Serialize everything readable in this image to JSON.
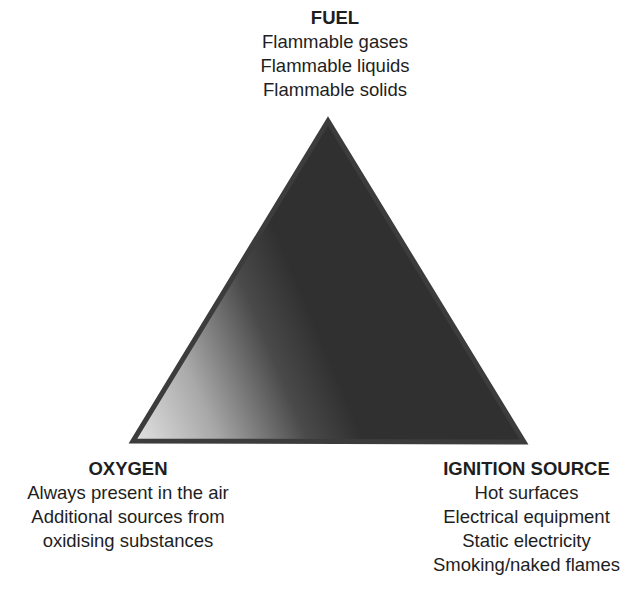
{
  "diagram": {
    "type": "fire-triangle",
    "shape": {
      "apex": [
        328,
        121
      ],
      "bottom_left": [
        131,
        442
      ],
      "bottom_right": [
        526,
        443
      ],
      "gradient_light": "#dcdcdc",
      "gradient_dark": "#303030",
      "stroke": "#3c3c3c"
    },
    "fuel": {
      "title": "FUEL",
      "items": [
        "Flammable gases",
        "Flammable liquids",
        "Flammable solids"
      ]
    },
    "oxygen": {
      "title": "OXYGEN",
      "items": [
        "Always present in the air",
        "Additional sources from",
        "oxidising substances"
      ]
    },
    "ignition": {
      "title": "IGNITION SOURCE",
      "items": [
        "Hot surfaces",
        "Electrical equipment",
        "Static electricity",
        "Smoking/naked flames"
      ]
    }
  }
}
